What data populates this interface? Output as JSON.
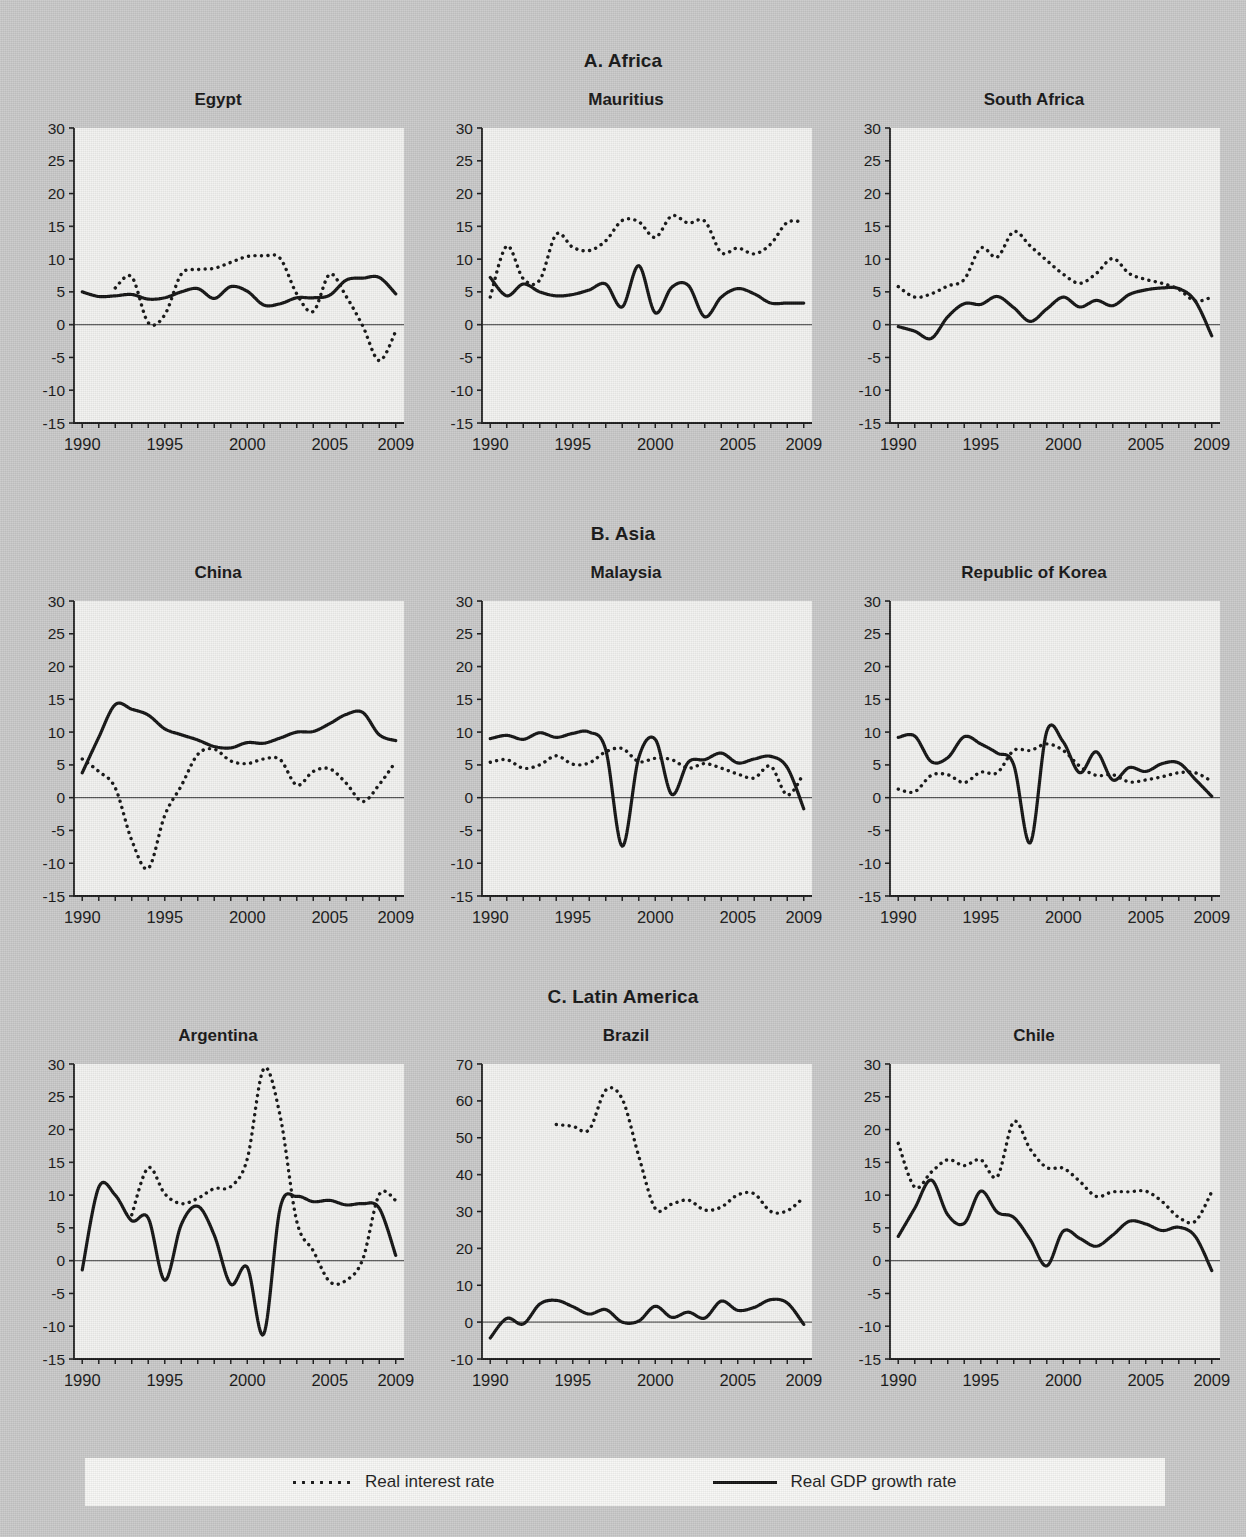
{
  "sections": [
    {
      "id": "africa",
      "label": "A. Africa"
    },
    {
      "id": "asia",
      "label": "B. Asia"
    },
    {
      "id": "latam",
      "label": "C. Latin America"
    }
  ],
  "legend": {
    "interest_label": "Real interest rate",
    "gdp_label": "Real GDP growth rate"
  },
  "axis": {
    "x_ticks": [
      "1990",
      "1995",
      "2000",
      "2005",
      "2009"
    ],
    "y_ticks_standard": [
      "30",
      "25",
      "20",
      "15",
      "10",
      "5",
      "0",
      "-5",
      "-10",
      "-15"
    ],
    "y_ticks_brazil": [
      "70",
      "60",
      "50",
      "40",
      "30",
      "20",
      "10",
      "0",
      "-10"
    ]
  },
  "colors": {
    "page_background": "#c9c9c9",
    "plot_background": "#f2f2f0",
    "series_line": "#111111",
    "axis": "#1a1a1a",
    "legend_background": "#f7f7f5"
  },
  "chart_data": [
    {
      "type": "line",
      "title": "Egypt",
      "section": "A. Africa",
      "xlabel": "",
      "ylabel": "",
      "x": [
        1990,
        1991,
        1992,
        1993,
        1994,
        1995,
        1996,
        1997,
        1998,
        1999,
        2000,
        2001,
        2002,
        2003,
        2004,
        2005,
        2006,
        2007,
        2008,
        2009
      ],
      "xlim": [
        1989.5,
        2009.5
      ],
      "ylim": [
        -15,
        30
      ],
      "grid": false,
      "legend_position": "figure-bottom",
      "series": [
        {
          "name": "Real GDP growth rate",
          "style": "solid",
          "values": [
            5.0,
            4.3,
            4.4,
            4.6,
            3.9,
            4.1,
            5.0,
            5.5,
            4.0,
            5.8,
            5.1,
            3.0,
            3.2,
            4.1,
            4.1,
            4.5,
            6.8,
            7.1,
            7.2,
            4.7
          ]
        },
        {
          "name": "Real interest rate",
          "style": "dotted",
          "values": [
            null,
            null,
            5.6,
            7.3,
            0.3,
            1.5,
            7.7,
            8.4,
            8.6,
            9.5,
            10.4,
            10.5,
            10.1,
            4.7,
            2.0,
            7.7,
            4.3,
            -0.2,
            -5.5,
            -1.0
          ]
        }
      ]
    },
    {
      "type": "line",
      "title": "Mauritius",
      "section": "A. Africa",
      "xlabel": "",
      "ylabel": "",
      "x": [
        1990,
        1991,
        1992,
        1993,
        1994,
        1995,
        1996,
        1997,
        1998,
        1999,
        2000,
        2001,
        2002,
        2003,
        2004,
        2005,
        2006,
        2007,
        2008,
        2009
      ],
      "xlim": [
        1989.5,
        2009.5
      ],
      "ylim": [
        -15,
        30
      ],
      "grid": false,
      "legend_position": "figure-bottom",
      "series": [
        {
          "name": "Real GDP growth rate",
          "style": "solid",
          "values": [
            7.2,
            4.4,
            6.2,
            5.0,
            4.4,
            4.6,
            5.3,
            6.2,
            2.7,
            9.0,
            1.8,
            5.7,
            6.0,
            1.2,
            4.2,
            5.5,
            4.7,
            3.3,
            3.3,
            3.3
          ]
        },
        {
          "name": "Real interest rate",
          "style": "dotted",
          "values": [
            4.2,
            12.0,
            7.0,
            6.8,
            13.8,
            11.8,
            11.3,
            12.8,
            15.9,
            15.7,
            13.3,
            16.6,
            15.5,
            15.8,
            11.0,
            11.7,
            10.8,
            12.3,
            15.6,
            15.6
          ]
        }
      ]
    },
    {
      "type": "line",
      "title": "South Africa",
      "section": "A. Africa",
      "xlabel": "",
      "ylabel": "",
      "x": [
        1990,
        1991,
        1992,
        1993,
        1994,
        1995,
        1996,
        1997,
        1998,
        1999,
        2000,
        2001,
        2002,
        2003,
        2004,
        2005,
        2006,
        2007,
        2008,
        2009
      ],
      "xlim": [
        1989.5,
        2009.5
      ],
      "ylim": [
        -15,
        30
      ],
      "grid": false,
      "legend_position": "figure-bottom",
      "series": [
        {
          "name": "Real GDP growth rate",
          "style": "solid",
          "values": [
            -0.3,
            -1.0,
            -2.1,
            1.2,
            3.2,
            3.1,
            4.3,
            2.6,
            0.5,
            2.4,
            4.2,
            2.7,
            3.7,
            2.9,
            4.6,
            5.3,
            5.6,
            5.5,
            3.6,
            -1.7
          ]
        },
        {
          "name": "Real interest rate",
          "style": "dotted",
          "values": [
            5.8,
            4.2,
            4.7,
            5.9,
            6.9,
            11.7,
            10.3,
            14.2,
            12.0,
            9.8,
            7.7,
            6.3,
            7.8,
            10.1,
            7.8,
            6.9,
            6.3,
            5.4,
            3.6,
            4.2
          ]
        }
      ]
    },
    {
      "type": "line",
      "title": "China",
      "section": "B. Asia",
      "xlabel": "",
      "ylabel": "",
      "x": [
        1990,
        1991,
        1992,
        1993,
        1994,
        1995,
        1996,
        1997,
        1998,
        1999,
        2000,
        2001,
        2002,
        2003,
        2004,
        2005,
        2006,
        2007,
        2008,
        2009
      ],
      "xlim": [
        1989.5,
        2009.5
      ],
      "ylim": [
        -15,
        30
      ],
      "grid": false,
      "legend_position": "figure-bottom",
      "series": [
        {
          "name": "Real GDP growth rate",
          "style": "solid",
          "values": [
            3.8,
            9.2,
            14.2,
            13.5,
            12.6,
            10.5,
            9.6,
            8.8,
            7.8,
            7.6,
            8.4,
            8.3,
            9.1,
            10.0,
            10.1,
            11.3,
            12.7,
            13.0,
            9.6,
            8.7
          ]
        },
        {
          "name": "Real interest rate",
          "style": "dotted",
          "values": [
            5.9,
            4.0,
            1.5,
            -6.5,
            -10.8,
            -2.7,
            1.8,
            6.6,
            7.4,
            5.6,
            5.2,
            5.9,
            5.8,
            1.9,
            4.0,
            4.4,
            2.2,
            -0.6,
            2.0,
            5.5
          ]
        }
      ]
    },
    {
      "type": "line",
      "title": "Malaysia",
      "section": "B. Asia",
      "xlabel": "",
      "ylabel": "",
      "x": [
        1990,
        1991,
        1992,
        1993,
        1994,
        1995,
        1996,
        1997,
        1998,
        1999,
        2000,
        2001,
        2002,
        2003,
        2004,
        2005,
        2006,
        2007,
        2008,
        2009
      ],
      "xlim": [
        1989.5,
        2009.5
      ],
      "ylim": [
        -15,
        30
      ],
      "grid": false,
      "legend_position": "figure-bottom",
      "series": [
        {
          "name": "Real GDP growth rate",
          "style": "solid",
          "values": [
            9.0,
            9.5,
            8.9,
            9.9,
            9.2,
            9.8,
            10.0,
            7.3,
            -7.4,
            6.1,
            8.9,
            0.5,
            5.4,
            5.8,
            6.8,
            5.3,
            5.9,
            6.3,
            4.6,
            -1.7
          ]
        },
        {
          "name": "Real interest rate",
          "style": "dotted",
          "values": [
            5.4,
            5.8,
            4.5,
            5.0,
            6.4,
            5.1,
            5.3,
            7.0,
            7.5,
            5.5,
            6.0,
            5.8,
            4.5,
            5.2,
            4.5,
            3.6,
            3.0,
            4.8,
            0.4,
            3.7
          ]
        }
      ]
    },
    {
      "type": "line",
      "title": "Republic of Korea",
      "section": "B. Asia",
      "xlabel": "",
      "ylabel": "",
      "x": [
        1990,
        1991,
        1992,
        1993,
        1994,
        1995,
        1996,
        1997,
        1998,
        1999,
        2000,
        2001,
        2002,
        2003,
        2004,
        2005,
        2006,
        2007,
        2008,
        2009
      ],
      "xlim": [
        1989.5,
        2009.5
      ],
      "ylim": [
        -15,
        30
      ],
      "grid": false,
      "legend_position": "figure-bottom",
      "series": [
        {
          "name": "Real GDP growth rate",
          "style": "solid",
          "values": [
            9.2,
            9.4,
            5.5,
            6.1,
            9.3,
            8.2,
            6.8,
            5.0,
            -6.9,
            10.1,
            8.5,
            3.8,
            7.0,
            2.7,
            4.6,
            4.0,
            5.2,
            5.3,
            2.8,
            0.2
          ]
        },
        {
          "name": "Real interest rate",
          "style": "dotted",
          "values": [
            1.3,
            0.9,
            3.4,
            3.5,
            2.3,
            3.9,
            3.8,
            7.2,
            7.2,
            8.2,
            7.2,
            4.8,
            3.4,
            3.5,
            2.4,
            2.7,
            3.2,
            3.8,
            3.8,
            2.5
          ]
        }
      ]
    },
    {
      "type": "line",
      "title": "Argentina",
      "section": "C. Latin America",
      "xlabel": "",
      "ylabel": "",
      "x": [
        1990,
        1991,
        1992,
        1993,
        1994,
        1995,
        1996,
        1997,
        1998,
        1999,
        2000,
        2001,
        2002,
        2003,
        2004,
        2005,
        2006,
        2007,
        2008,
        2009
      ],
      "xlim": [
        1989.5,
        2009.5
      ],
      "ylim": [
        -15,
        30
      ],
      "grid": false,
      "legend_position": "figure-bottom",
      "series": [
        {
          "name": "Real GDP growth rate",
          "style": "solid",
          "values": [
            -1.4,
            11.2,
            10.0,
            6.1,
            6.5,
            -3.0,
            5.5,
            8.3,
            3.9,
            -3.6,
            -1.0,
            -11.2,
            8.1,
            9.8,
            9.0,
            9.2,
            8.5,
            8.7,
            8.0,
            0.8
          ]
        },
        {
          "name": "Real interest rate",
          "style": "dotted",
          "values": [
            null,
            null,
            null,
            7.0,
            14.2,
            10.2,
            8.7,
            9.5,
            11.0,
            11.3,
            15.5,
            29.3,
            22.0,
            6.0,
            1.5,
            -3.2,
            -3.0,
            0.2,
            10.1,
            9.2
          ]
        }
      ]
    },
    {
      "type": "line",
      "title": "Brazil",
      "section": "C. Latin America",
      "xlabel": "",
      "ylabel": "",
      "x": [
        1990,
        1991,
        1992,
        1993,
        1994,
        1995,
        1996,
        1997,
        1998,
        1999,
        2000,
        2001,
        2002,
        2003,
        2004,
        2005,
        2006,
        2007,
        2008,
        2009
      ],
      "xlim": [
        1989.5,
        2009.5
      ],
      "ylim": [
        -10,
        70
      ],
      "grid": false,
      "legend_position": "figure-bottom",
      "series": [
        {
          "name": "Real GDP growth rate",
          "style": "solid",
          "values": [
            -4.3,
            1.0,
            -0.5,
            4.9,
            5.9,
            4.2,
            2.2,
            3.4,
            0.0,
            0.3,
            4.3,
            1.3,
            2.7,
            1.1,
            5.7,
            3.2,
            4.0,
            6.1,
            5.2,
            -0.6
          ]
        },
        {
          "name": "Real interest rate",
          "style": "dotted",
          "values": [
            null,
            null,
            null,
            null,
            53.6,
            53.1,
            52.2,
            62.9,
            60.5,
            45.0,
            30.8,
            32.0,
            33.1,
            30.4,
            31.2,
            34.5,
            34.8,
            30.0,
            30.2,
            33.8
          ]
        }
      ]
    },
    {
      "type": "line",
      "title": "Chile",
      "section": "C. Latin America",
      "xlabel": "",
      "ylabel": "",
      "x": [
        1990,
        1991,
        1992,
        1993,
        1994,
        1995,
        1996,
        1997,
        1998,
        1999,
        2000,
        2001,
        2002,
        2003,
        2004,
        2005,
        2006,
        2007,
        2008,
        2009
      ],
      "xlim": [
        1989.5,
        2009.5
      ],
      "ylim": [
        -15,
        30
      ],
      "grid": false,
      "legend_position": "figure-bottom",
      "series": [
        {
          "name": "Real GDP growth rate",
          "style": "solid",
          "values": [
            3.7,
            8.0,
            12.3,
            7.0,
            5.7,
            10.6,
            7.4,
            6.6,
            3.2,
            -0.8,
            4.5,
            3.4,
            2.2,
            3.9,
            6.0,
            5.6,
            4.6,
            5.1,
            3.7,
            -1.5
          ]
        },
        {
          "name": "Real interest rate",
          "style": "dotted",
          "values": [
            17.9,
            11.2,
            13.5,
            15.4,
            14.5,
            15.4,
            12.8,
            21.2,
            17.0,
            14.2,
            14.1,
            12.1,
            9.8,
            10.5,
            10.5,
            10.6,
            9.0,
            6.6,
            6.0,
            10.5
          ]
        }
      ]
    }
  ]
}
